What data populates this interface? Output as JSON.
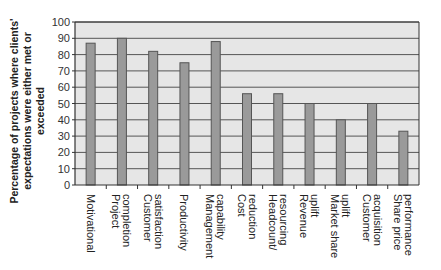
{
  "chart_data": {
    "type": "bar",
    "title": "",
    "xlabel": "",
    "ylabel": "Percentage of projects where clients' expectations were either met or exceeded",
    "ylabel_lines": [
      "Percentage of projects where clients'",
      "expectations were either met or exceeded"
    ],
    "ylim": [
      0,
      100
    ],
    "yticks": [
      0,
      10,
      20,
      30,
      40,
      50,
      60,
      70,
      80,
      90,
      100
    ],
    "grid": true,
    "legend": null,
    "categories": [
      "Motivational",
      "Project completion",
      "Customer satisfaction",
      "Productivity",
      "Management capability",
      "Cost reduction",
      "Headcount/ resourcing",
      "Revenue uplift",
      "Market share uplift",
      "Customer acquisition",
      "Share price performance"
    ],
    "category_lines": [
      [
        "Motivational"
      ],
      [
        "Project",
        "completion"
      ],
      [
        "Customer",
        "satisfaction"
      ],
      [
        "Productivity"
      ],
      [
        "Management",
        "capability"
      ],
      [
        "Cost",
        "reduction"
      ],
      [
        "Headcount/",
        "resourcing"
      ],
      [
        "Revenue",
        "uplift"
      ],
      [
        "Market share",
        "uplift"
      ],
      [
        "Customer",
        "acquisition"
      ],
      [
        "Share price",
        "performance"
      ]
    ],
    "values": [
      87,
      90,
      82,
      75,
      88,
      56,
      56,
      50,
      40,
      50,
      33
    ]
  },
  "colors": {
    "bar_fill": "#9a9a9a",
    "bar_stroke": "#555555",
    "plot_bg": "#e6e6e6",
    "grid": "#555555"
  }
}
